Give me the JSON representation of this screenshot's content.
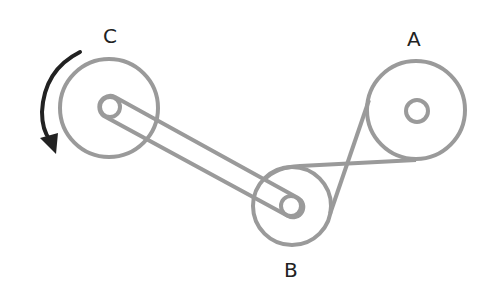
{
  "diagram": {
    "colors": {
      "pulley": "#9a9a9a",
      "belt": "#9a9a9a",
      "arrow": "#222222",
      "label": "#222222"
    },
    "pulleys": [
      {
        "id": "A",
        "label": "A",
        "cx": 416,
        "cy": 110,
        "r": 49,
        "hub_r": 11
      },
      {
        "id": "B",
        "label": "B",
        "cx": 292,
        "cy": 206,
        "r": 39,
        "hub_r": 10
      },
      {
        "id": "C",
        "label": "C",
        "cx": 109,
        "cy": 108,
        "r": 49,
        "hub_r": 10
      }
    ],
    "rotation": {
      "pulley": "C",
      "direction": "counterclockwise"
    }
  }
}
